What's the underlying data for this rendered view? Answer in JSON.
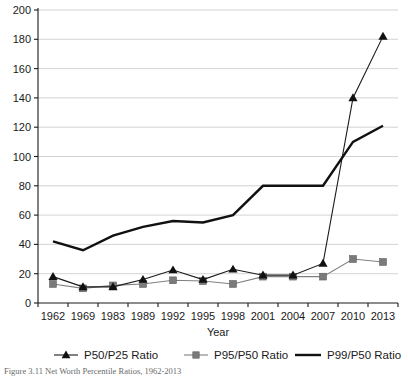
{
  "chart_data": {
    "type": "line",
    "title": "",
    "xlabel": "Year",
    "ylabel": "",
    "categories": [
      "1962",
      "1969",
      "1983",
      "1989",
      "1992",
      "1995",
      "1998",
      "2001",
      "2004",
      "2007",
      "2010",
      "2013"
    ],
    "ylim": [
      0,
      200
    ],
    "yticks": [
      0,
      20,
      40,
      60,
      80,
      100,
      120,
      140,
      160,
      180,
      200
    ],
    "grid": true,
    "legend_position": "bottom",
    "series": [
      {
        "name": "P50/P25 Ratio",
        "marker": "triangle",
        "color": "#111111",
        "values": [
          18,
          11,
          11,
          16,
          22.5,
          16,
          23,
          19,
          19,
          27,
          140,
          182
        ]
      },
      {
        "name": "P95/P50 Ratio",
        "marker": "square",
        "color": "#7a7a7a",
        "values": [
          13,
          10,
          12,
          13,
          15.5,
          15,
          13,
          18,
          18,
          18,
          30,
          28
        ]
      },
      {
        "name": "P99/P50 Ratio",
        "marker": "none",
        "color": "#111111",
        "values": [
          42,
          36,
          46,
          52,
          56,
          55,
          60,
          80,
          80,
          80,
          110,
          121
        ]
      }
    ]
  },
  "caption": {
    "text": "Figure 3.11 Net Worth Percentile Ratios, 1962-2013"
  }
}
